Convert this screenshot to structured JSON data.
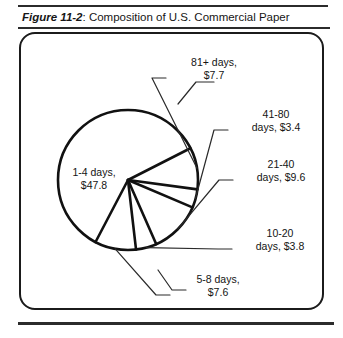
{
  "figure": {
    "number_label": "Figure 11-2",
    "separator": ": ",
    "title_text": "Composition of U.S. Commercial Paper"
  },
  "chart_data": {
    "type": "pie",
    "title": "Composition of U.S. Commercial Paper",
    "subtitle": "",
    "xlabel": "",
    "ylabel": "",
    "units": "$ (billions)",
    "value_prefix": "$",
    "legend": "none",
    "grid": false,
    "start_angle_deg": -27,
    "direction": "clockwise",
    "total": 79.9,
    "categories": [
      "81+ days",
      "41-80 days",
      "21-40 days",
      "10-20 days",
      "5-8 days",
      "1-4 days"
    ],
    "values": [
      7.7,
      3.4,
      9.6,
      3.8,
      7.6,
      47.8
    ],
    "slices": [
      {
        "name": "81+ days",
        "value": 7.7,
        "label_line1": "81+ days,",
        "label_line2": "$7.7",
        "label_x": 214,
        "label_y": 66,
        "label_anchor": "middle"
      },
      {
        "name": "41-80 days",
        "value": 3.4,
        "label_line1": "41-80",
        "label_line2": "days,  $3.4",
        "label_x": 276,
        "label_y": 118,
        "label_anchor": "middle"
      },
      {
        "name": "21-40 days",
        "value": 9.6,
        "label_line1": "21-40",
        "label_line2": "days,  $9.6",
        "label_x": 281,
        "label_y": 168,
        "label_anchor": "middle"
      },
      {
        "name": "10-20 days",
        "value": 3.8,
        "label_line1": "10-20",
        "label_line2": "days,  $3.8",
        "label_x": 280,
        "label_y": 237,
        "label_anchor": "middle"
      },
      {
        "name": "5-8 days",
        "value": 7.6,
        "label_line1": "5-8 days,",
        "label_line2": "$7.6",
        "label_x": 218,
        "label_y": 283,
        "label_anchor": "middle"
      },
      {
        "name": "1-4 days",
        "value": 47.8,
        "label_line1": "1-4 days,",
        "label_line2": "$47.8",
        "label_x": 94,
        "label_y": 176,
        "label_anchor": "middle"
      }
    ]
  }
}
